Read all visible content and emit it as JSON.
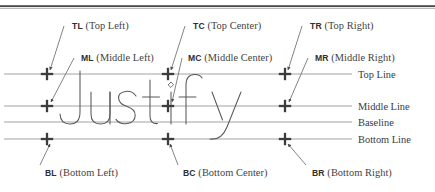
{
  "diagram": {
    "word": "Justify",
    "top_rule": {
      "name": "top-border-rule",
      "color": "#4a4a4c"
    },
    "colors": {
      "ink": "#3a3a3c",
      "rule": "#8a8a8e",
      "marker": "#3c3c3e",
      "glyph_outline": "#58585c",
      "leader": "#6e6e72",
      "background": "#ffffff"
    },
    "guide_lines": [
      {
        "key": "top",
        "label": "Top Line",
        "y": 74
      },
      {
        "key": "middle",
        "label": "Middle Line",
        "y": 106
      },
      {
        "key": "baseline",
        "label": "Baseline",
        "y": 122
      },
      {
        "key": "bottom",
        "label": "Bottom Line",
        "y": 139
      }
    ],
    "anchor_columns": [
      {
        "key": "left",
        "x": 47
      },
      {
        "key": "center",
        "x": 168
      },
      {
        "key": "right",
        "x": 285
      }
    ],
    "anchors": [
      {
        "key": "TL",
        "abbr": "TL",
        "paren": "(Top Left)",
        "marker_x": 47,
        "marker_y": 74,
        "label_x": 72,
        "label_y": 21,
        "leader": [
          64,
          26,
          50,
          70
        ]
      },
      {
        "key": "TC",
        "abbr": "TC",
        "paren": "(Top Center)",
        "marker_x": 168,
        "marker_y": 74,
        "label_x": 193,
        "label_y": 21,
        "leader": [
          185,
          26,
          171,
          70
        ]
      },
      {
        "key": "TR",
        "abbr": "TR",
        "paren": "(Top Right)",
        "marker_x": 285,
        "marker_y": 74,
        "label_x": 310,
        "label_y": 21,
        "leader": [
          302,
          26,
          288,
          70
        ]
      },
      {
        "key": "ML",
        "abbr": "ML",
        "paren": "(Middle Left)",
        "marker_x": 47,
        "marker_y": 106,
        "label_x": 81,
        "label_y": 53,
        "leader": [
          74,
          58,
          51,
          102
        ]
      },
      {
        "key": "MC",
        "abbr": "MC",
        "paren": "(Middle Center)",
        "marker_x": 168,
        "marker_y": 106,
        "label_x": 188,
        "label_y": 53,
        "leader": [
          182,
          58,
          172,
          102
        ]
      },
      {
        "key": "MR",
        "abbr": "MR",
        "paren": "(Middle Right)",
        "marker_x": 285,
        "marker_y": 106,
        "label_x": 315,
        "label_y": 53,
        "leader": [
          308,
          58,
          289,
          102
        ]
      },
      {
        "key": "BL",
        "abbr": "BL",
        "paren": "(Bottom Left)",
        "marker_x": 47,
        "marker_y": 139,
        "label_x": 45,
        "label_y": 168,
        "leader": [
          40,
          165,
          50,
          144
        ]
      },
      {
        "key": "BC",
        "abbr": "BC",
        "paren": "(Bottom Center)",
        "marker_x": 168,
        "marker_y": 139,
        "label_x": 183,
        "label_y": 168,
        "leader": [
          178,
          165,
          170,
          144
        ]
      },
      {
        "key": "BR",
        "abbr": "BR",
        "paren": "(Bottom Right)",
        "marker_x": 285,
        "marker_y": 139,
        "label_x": 312,
        "label_y": 168,
        "leader": [
          306,
          165,
          288,
          144
        ]
      }
    ],
    "line_labels": [
      {
        "key": "top",
        "text": "Top Line",
        "x": 358,
        "y": 70
      },
      {
        "key": "middle",
        "text": "Middle Line",
        "x": 358,
        "y": 102
      },
      {
        "key": "baseline",
        "text": "Baseline",
        "x": 358,
        "y": 118
      },
      {
        "key": "bottom",
        "text": "Bottom Line",
        "x": 358,
        "y": 135
      }
    ]
  }
}
